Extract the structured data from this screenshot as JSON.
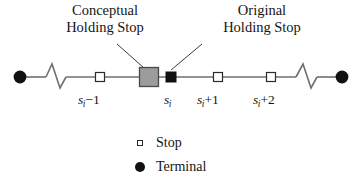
{
  "figure": {
    "type": "transit-line-diagram",
    "background_color": "#ffffff",
    "line_color": "#6f6f6f",
    "callouts": [
      {
        "id": "conceptual",
        "line1": "Conceptual",
        "line2": "Holding Stop",
        "points_to": "conceptual-holding-stop-marker"
      },
      {
        "id": "original",
        "line1": "Original",
        "line2": "Holding Stop",
        "points_to": "original-holding-stop-marker"
      }
    ],
    "stop_labels": [
      {
        "id": "sm1",
        "base": "s",
        "subscript": "i",
        "operator": "−1"
      },
      {
        "id": "s",
        "base": "s",
        "subscript": "i",
        "operator": ""
      },
      {
        "id": "sp1",
        "base": "s",
        "subscript": "i",
        "operator": "+1"
      },
      {
        "id": "sp2",
        "base": "s",
        "subscript": "i",
        "operator": "+2"
      }
    ],
    "markers": [
      {
        "id": "terminal-left",
        "kind": "terminal",
        "fill": "#111111"
      },
      {
        "id": "stop-sm1",
        "kind": "stop",
        "fill": "#ffffff"
      },
      {
        "id": "conceptual-holding-stop-marker",
        "kind": "conceptual-holding-stop",
        "fill": "#9c9c9c"
      },
      {
        "id": "original-holding-stop-marker",
        "kind": "original-holding-stop",
        "fill": "#111111"
      },
      {
        "id": "stop-sp1",
        "kind": "stop",
        "fill": "#ffffff"
      },
      {
        "id": "stop-sp2",
        "kind": "stop",
        "fill": "#ffffff"
      },
      {
        "id": "terminal-right",
        "kind": "terminal",
        "fill": "#111111"
      }
    ],
    "legend": [
      {
        "id": "stop",
        "symbol": "open-square-icon",
        "label": "Stop"
      },
      {
        "id": "terminal",
        "symbol": "filled-circle-icon",
        "label": "Terminal"
      }
    ]
  }
}
